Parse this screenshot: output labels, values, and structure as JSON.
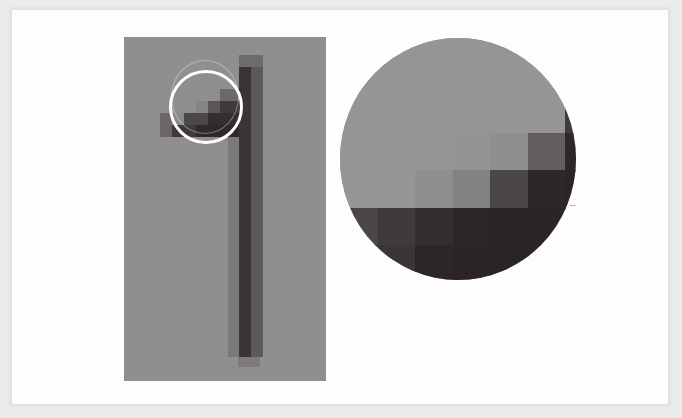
{
  "figure": {
    "background_color": "#fdfdfd",
    "panel_color": "#8f8f8f",
    "loupe_color": "#ffffff"
  },
  "left_panel": {
    "x": 124,
    "y": 37,
    "w": 202,
    "h": 344,
    "blocks": [
      {
        "x": 115,
        "y": 18,
        "w": 24,
        "h": 12,
        "c": "#6f6a6e"
      },
      {
        "x": 115,
        "y": 30,
        "w": 12,
        "h": 290,
        "c": "#3a3338"
      },
      {
        "x": 127,
        "y": 30,
        "w": 12,
        "h": 290,
        "c": "#5d585c"
      },
      {
        "x": 104,
        "y": 100,
        "w": 11,
        "h": 220,
        "c": "#7b787a"
      },
      {
        "x": 114,
        "y": 320,
        "w": 22,
        "h": 10,
        "c": "#7d7a7c"
      },
      {
        "x": 36,
        "y": 76,
        "w": 12,
        "h": 24,
        "c": "#6a666a"
      },
      {
        "x": 48,
        "y": 76,
        "w": 12,
        "h": 12,
        "c": "#8a8a8a"
      },
      {
        "x": 48,
        "y": 88,
        "w": 24,
        "h": 12,
        "c": "#3f393d"
      },
      {
        "x": 60,
        "y": 76,
        "w": 24,
        "h": 12,
        "c": "#4c474b"
      },
      {
        "x": 72,
        "y": 88,
        "w": 43,
        "h": 12,
        "c": "#2f292d"
      },
      {
        "x": 72,
        "y": 64,
        "w": 12,
        "h": 12,
        "c": "#858385"
      },
      {
        "x": 84,
        "y": 64,
        "w": 12,
        "h": 12,
        "c": "#5a5559"
      },
      {
        "x": 84,
        "y": 76,
        "w": 31,
        "h": 12,
        "c": "#342e32"
      },
      {
        "x": 96,
        "y": 52,
        "w": 19,
        "h": 12,
        "c": "#6c686b"
      },
      {
        "x": 96,
        "y": 64,
        "w": 19,
        "h": 12,
        "c": "#403a3e"
      }
    ]
  },
  "loupe": {
    "cx": 206,
    "cy": 107,
    "r": 37
  },
  "zoom_inset": {
    "cx": 458,
    "cy": 159,
    "r": 118,
    "block": 37.5,
    "origin_x": 340,
    "origin_y": 20,
    "grid": [
      [
        "#959595",
        "#959595",
        "#959595",
        "#959595",
        "#959595",
        "#959595",
        "#818081"
      ],
      [
        "#959595",
        "#959595",
        "#959595",
        "#959595",
        "#959595",
        "#959595",
        "#5e5a5d"
      ],
      [
        "#959595",
        "#959595",
        "#959595",
        "#959595",
        "#959595",
        "#959595",
        "#403a3e"
      ],
      [
        "#959595",
        "#959595",
        "#959595",
        "#949494",
        "#8e8e8e",
        "#615d60",
        "#2d272b"
      ],
      [
        "#969696",
        "#959595",
        "#8f8f8f",
        "#838283",
        "#4b464a",
        "#2d272b",
        "#2b2529"
      ],
      [
        "#4a4549",
        "#403a3e",
        "#332d31",
        "#2c262a",
        "#2a2428",
        "#2a2428",
        "#2a2428"
      ],
      [
        "#403b3f",
        "#3b3539",
        "#2c262a",
        "#2a2428",
        "#2a2428",
        "#2a2428",
        "#2a2428"
      ]
    ]
  }
}
